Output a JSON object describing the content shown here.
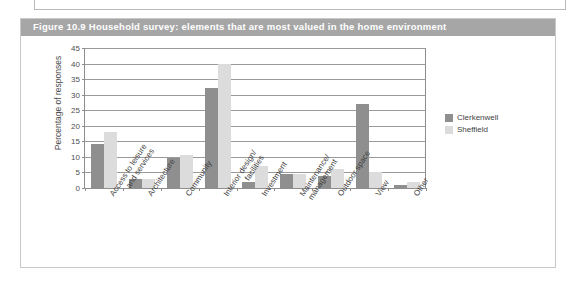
{
  "figure": {
    "caption": "Figure 10.9  Household survey: elements that are most valued in the home environment"
  },
  "legend": {
    "position": "right",
    "entries": [
      {
        "label": "Clerkenwell",
        "color": "#8f8f8f"
      },
      {
        "label": "Sheffield",
        "color": "#dcdcdc"
      }
    ]
  },
  "chart_data": {
    "type": "bar",
    "title": "Figure 10.9  Household survey: elements that are most valued in the home environment",
    "xlabel": "",
    "ylabel": "Percentage of responses",
    "ylim": [
      0,
      45
    ],
    "yticks": [
      0,
      5,
      10,
      15,
      20,
      25,
      30,
      35,
      40,
      45
    ],
    "ytick_labels": [
      "0",
      "5",
      "10",
      "15",
      "20",
      "25",
      "30",
      "35",
      "40",
      "45"
    ],
    "grid": true,
    "categories": [
      "Access to leisure and services",
      "Architecture",
      "Community",
      "Interior design/ facilities",
      "Investment",
      "Maintenance/ management",
      "Outdoor space",
      "View",
      "Other"
    ],
    "category_lines": [
      [
        "Access to leisure",
        "and services"
      ],
      [
        "Architecture",
        ""
      ],
      [
        "Community",
        ""
      ],
      [
        "Interior design/",
        "facilities"
      ],
      [
        "Investment",
        ""
      ],
      [
        "Maintenance/",
        "management"
      ],
      [
        "Outdoor space",
        ""
      ],
      [
        "View",
        ""
      ],
      [
        "Other",
        ""
      ]
    ],
    "series": [
      {
        "name": "Clerkenwell",
        "color": "#8f8f8f",
        "values": [
          14,
          3,
          9.5,
          32,
          2,
          4.5,
          4,
          27,
          1
        ]
      },
      {
        "name": "Sheffield",
        "color": "#dcdcdc",
        "values": [
          18,
          3,
          10.5,
          40,
          7,
          4.5,
          6,
          5,
          2
        ]
      }
    ]
  }
}
